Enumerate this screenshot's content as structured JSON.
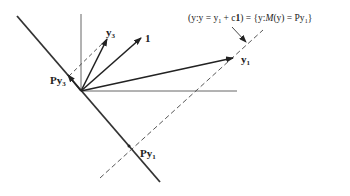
{
  "labels": {
    "y3": "y",
    "y3_sub": "3",
    "one": "1",
    "y1": "y",
    "y1_sub": "1",
    "Py3_P": "P",
    "Py3_y": "y",
    "Py3_sub": "3",
    "Py1_P": "P",
    "Py1_y": "y",
    "Py1_sub": "1",
    "set_eq_a": "(y:y = y",
    "set_eq_a_sub": "1",
    "set_eq_b": " + c",
    "set_eq_c": "1",
    "set_eq_d": ") = {y:",
    "set_eq_e": "M",
    "set_eq_f": "(y) = Py",
    "set_eq_f_sub": "1",
    "set_eq_g": "}"
  },
  "colors": {
    "ink": "#222222",
    "dashed": "#444444"
  }
}
